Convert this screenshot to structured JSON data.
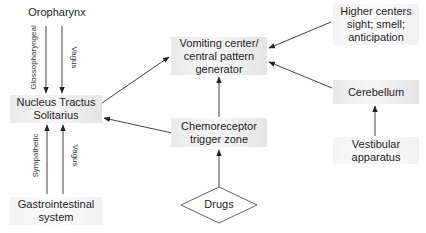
{
  "diagram": {
    "type": "flowchart",
    "title": "",
    "nodes": [
      {
        "id": "oropharynx",
        "label": "Oropharynx",
        "shape": "text"
      },
      {
        "id": "nts",
        "label_lines": [
          "Nucleus Tractus",
          "Solitarius"
        ],
        "shape": "box"
      },
      {
        "id": "gi",
        "label_lines": [
          "Gastrointestinal",
          "system"
        ],
        "shape": "box"
      },
      {
        "id": "vomiting_center",
        "label_lines": [
          "Vomiting center/",
          "central pattern",
          "generator"
        ],
        "shape": "box"
      },
      {
        "id": "ctz",
        "label_lines": [
          "Chemoreceptor",
          "trigger zone"
        ],
        "shape": "box"
      },
      {
        "id": "drugs",
        "label": "Drugs",
        "shape": "diamond"
      },
      {
        "id": "higher_centers",
        "label_lines": [
          "Higher centers",
          "sight; smell;",
          "anticipation"
        ],
        "shape": "box"
      },
      {
        "id": "cerebellum",
        "label": "Cerebellum",
        "shape": "box"
      },
      {
        "id": "vestibular",
        "label_lines": [
          "Vestibular",
          "apparatus"
        ],
        "shape": "box"
      }
    ],
    "edges": [
      {
        "from": "oropharynx",
        "to": "nts",
        "label": "Glossopharyngeal"
      },
      {
        "from": "oropharynx",
        "to": "nts",
        "label": "Vagus"
      },
      {
        "from": "gi",
        "to": "nts",
        "label": "Sympathetic"
      },
      {
        "from": "gi",
        "to": "nts",
        "label": "Vagus"
      },
      {
        "from": "nts",
        "to": "vomiting_center",
        "label": ""
      },
      {
        "from": "ctz",
        "to": "nts",
        "label": ""
      },
      {
        "from": "ctz",
        "to": "vomiting_center",
        "label": ""
      },
      {
        "from": "drugs",
        "to": "ctz",
        "label": ""
      },
      {
        "from": "higher_centers",
        "to": "vomiting_center",
        "label": ""
      },
      {
        "from": "cerebellum",
        "to": "vomiting_center",
        "label": ""
      },
      {
        "from": "vestibular",
        "to": "cerebellum",
        "label": ""
      }
    ]
  },
  "labels": {
    "oropharynx": "Oropharynx",
    "nts_1": "Nucleus Tractus",
    "nts_2": "Solitarius",
    "gi_1": "Gastrointestinal",
    "gi_2": "system",
    "vc_1": "Vomiting center/",
    "vc_2": "central pattern",
    "vc_3": "generator",
    "ctz_1": "Chemoreceptor",
    "ctz_2": "trigger zone",
    "drugs": "Drugs",
    "hc_1": "Higher centers",
    "hc_2": "sight; smell;",
    "hc_3": "anticipation",
    "cerebellum": "Cerebellum",
    "vest_1": "Vestibular",
    "vest_2": "apparatus",
    "edge_glossopharyngeal": "Glossopharyngeal",
    "edge_vagus_top": "Vagus",
    "edge_sympathetic": "Sympathetic",
    "edge_vagus_bottom": "Vagus"
  },
  "colors": {
    "line": "#333333",
    "box_fill": "#ececec",
    "text": "#1e1e1e"
  }
}
